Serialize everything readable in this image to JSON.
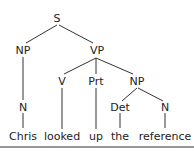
{
  "tree": {
    "nodes": {
      "S": {
        "label": "S",
        "x": 57,
        "y": 18
      },
      "NP1": {
        "label": "NP",
        "x": 23,
        "y": 50
      },
      "VP": {
        "label": "VP",
        "x": 97,
        "y": 50
      },
      "N1": {
        "label": "N",
        "x": 23,
        "y": 107
      },
      "V": {
        "label": "V",
        "x": 62,
        "y": 81
      },
      "Prt": {
        "label": "Prt",
        "x": 96,
        "y": 81
      },
      "NP2": {
        "label": "NP",
        "x": 137,
        "y": 81
      },
      "Det": {
        "label": "Det",
        "x": 120,
        "y": 107
      },
      "N2": {
        "label": "N",
        "x": 165,
        "y": 107
      }
    },
    "words": {
      "w1": {
        "label": "Chris",
        "x": 23,
        "y": 136
      },
      "w2": {
        "label": "looked",
        "x": 62,
        "y": 136
      },
      "w3": {
        "label": "up",
        "x": 96,
        "y": 136
      },
      "w4": {
        "label": "the",
        "x": 120,
        "y": 136
      },
      "w5": {
        "label": "reference",
        "x": 165,
        "y": 136
      }
    },
    "line_color": "#333333"
  }
}
